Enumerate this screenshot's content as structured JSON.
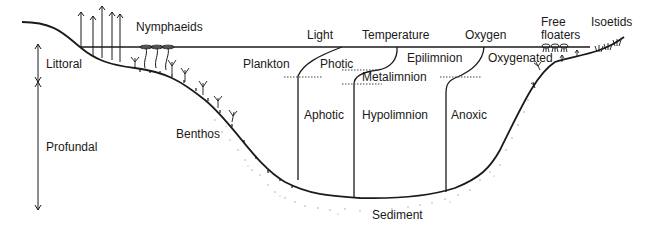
{
  "diagram": {
    "type": "lake-zonation-cross-section",
    "colors": {
      "line": "#1a1a1a",
      "dotted": "#444444",
      "sediment": "#9a9a9a",
      "background": "#ffffff"
    },
    "zones_left": {
      "littoral": "Littoral",
      "profundal": "Profundal"
    },
    "plant_groups": {
      "nymphaeids": "Nymphaeids",
      "free_floaters_line1": "Free",
      "free_floaters_line2": "floaters",
      "isoetids": "Isoetids"
    },
    "communities": {
      "plankton": "Plankton",
      "benthos": "Benthos",
      "sediment": "Sediment"
    },
    "profiles": {
      "light": {
        "title": "Light",
        "upper": "Photic",
        "lower": "Aphotic"
      },
      "temperature": {
        "title": "Temperature",
        "upper": "Epilimnion",
        "middle": "Metalimnion",
        "lower": "Hypolimnion"
      },
      "oxygen": {
        "title": "Oxygen",
        "upper": "Oxygenated",
        "lower": "Anoxic"
      }
    }
  }
}
